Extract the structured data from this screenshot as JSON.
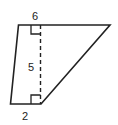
{
  "diagram": {
    "shape": "trapezoid",
    "labels": {
      "top_base": "6",
      "height": "5",
      "bottom_base": "2"
    },
    "colors": {
      "stroke": "#222222",
      "background": "#ffffff"
    }
  }
}
